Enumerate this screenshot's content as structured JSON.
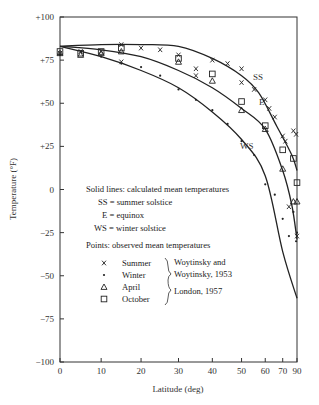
{
  "chart_data": {
    "type": "line",
    "title": "",
    "xlabel": "Latitude (deg)",
    "ylabel": "Temperature (°F)",
    "x_scale": "sine",
    "xlim": [
      0,
      90
    ],
    "ylim": [
      -100,
      100
    ],
    "x_ticks": [
      0,
      10,
      20,
      30,
      40,
      50,
      60,
      70,
      90
    ],
    "y_ticks": [
      100,
      75,
      50,
      25,
      0,
      -25,
      -50,
      -75,
      -100
    ],
    "y_tick_labels": [
      "+100",
      "+75",
      "+50",
      "+25",
      "0",
      "−25",
      "−50",
      "−75",
      "−100"
    ],
    "grid": false,
    "series": [
      {
        "name": "SS",
        "description": "summer solstice (calculated)",
        "style": "solid",
        "x": [
          0,
          10,
          20,
          30,
          40,
          50,
          57,
          66,
          78,
          90
        ],
        "y": [
          83,
          84,
          84,
          83,
          76,
          66,
          56,
          37,
          20,
          11
        ]
      },
      {
        "name": "E",
        "description": "equinox (calculated)",
        "style": "solid",
        "x": [
          0,
          10,
          20,
          30,
          40,
          50,
          60,
          70,
          78,
          90
        ],
        "y": [
          83,
          81,
          77,
          69,
          59,
          47,
          35,
          11,
          -9,
          -29
        ]
      },
      {
        "name": "WS",
        "description": "winter solstice (calculated)",
        "style": "solid",
        "x": [
          0,
          10,
          20,
          30,
          40,
          50,
          60,
          70,
          90
        ],
        "y": [
          83,
          77,
          69,
          59,
          45,
          29,
          8,
          -36,
          -63
        ]
      }
    ],
    "points": [
      {
        "name": "Summer",
        "marker": "x",
        "source": "Woytinsky and Woytinsky, 1953",
        "x": [
          0,
          5,
          10,
          15,
          15,
          20,
          25,
          30,
          35,
          35,
          40,
          45,
          50,
          50,
          55,
          60,
          62,
          65,
          70,
          72,
          75,
          80,
          85,
          90
        ],
        "y": [
          79,
          80,
          80,
          84,
          74,
          82,
          81,
          78,
          70,
          66,
          75,
          73,
          70,
          62,
          58,
          52,
          47,
          42,
          31,
          28,
          -10,
          34,
          32,
          -27
        ]
      },
      {
        "name": "Winter",
        "marker": "dot",
        "source": "Woytinsky and Woytinsky, 1953",
        "x": [
          0,
          10,
          15,
          20,
          25,
          30,
          35,
          40,
          45,
          50,
          55,
          60,
          65,
          70,
          75,
          80,
          85,
          90
        ],
        "y": [
          78,
          77,
          73,
          71,
          66,
          58,
          52,
          46,
          38,
          28,
          20,
          3,
          -3,
          -17,
          -27,
          -13,
          -30,
          -25
        ]
      },
      {
        "name": "April",
        "marker": "triangle",
        "source": "London, 1957",
        "x": [
          0,
          5,
          10,
          15,
          30,
          40,
          50,
          60,
          70,
          80,
          90
        ],
        "y": [
          79,
          78,
          79,
          80,
          74,
          63,
          46,
          35,
          12,
          -7,
          -7
        ]
      },
      {
        "name": "October",
        "marker": "square",
        "source": "London, 1957",
        "x": [
          0,
          5,
          10,
          15,
          30,
          40,
          50,
          60,
          70,
          80,
          90
        ],
        "y": [
          80,
          79,
          80,
          82,
          76,
          67,
          51,
          37,
          23,
          18,
          4
        ]
      }
    ],
    "curve_labels": [
      "SS",
      "E",
      "WS"
    ],
    "annotations": {
      "solid_lines_heading": "Solid lines: calculated mean temperatures",
      "solid_lines_defs": [
        "SS = summer solstice",
        "E = equinox",
        "WS = winter solstice"
      ],
      "points_heading": "Points: observed mean temperatures",
      "points_legend": [
        {
          "marker": "x",
          "label": "Summer"
        },
        {
          "marker": "dot",
          "label": "Winter"
        },
        {
          "marker": "triangle",
          "label": "April"
        },
        {
          "marker": "square",
          "label": "October"
        }
      ],
      "sources": [
        "Woytinsky and",
        "Woytinsky, 1953",
        "London, 1957"
      ]
    },
    "legend_position": "inside-lower-left"
  }
}
